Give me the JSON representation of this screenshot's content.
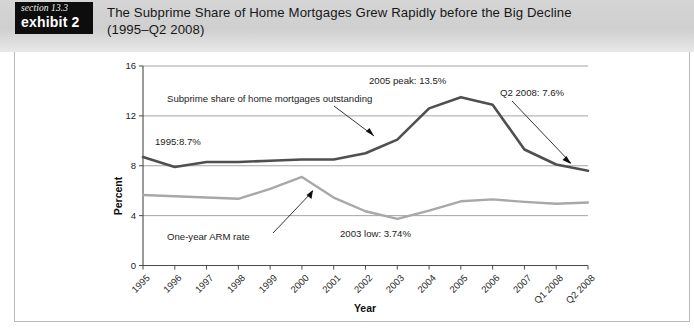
{
  "header": {
    "badge_section": "section 13.3",
    "badge_exhibit": "exhibit 2",
    "title_line1": "The Subprime Share of Home Mortgages Grew Rapidly before the Big Decline",
    "title_line2": "(1995–Q2 2008)"
  },
  "chart_data": {
    "type": "line",
    "title": "",
    "xlabel": "Year",
    "ylabel": "Percent",
    "ylim": [
      0,
      16
    ],
    "yticks": [
      0,
      4,
      8,
      12,
      16
    ],
    "grid": true,
    "legend": "none",
    "categories": [
      "1995",
      "1996",
      "1997",
      "1998",
      "1999",
      "2000",
      "2001",
      "2002",
      "2003",
      "2004",
      "2005",
      "2006",
      "2007",
      "Q1 2008",
      "Q2 2008"
    ],
    "series": [
      {
        "name": "Subprime share of home mortgages outstanding",
        "color": "#4f4f4f",
        "values": [
          8.7,
          7.9,
          8.3,
          8.3,
          8.4,
          8.5,
          8.5,
          9.0,
          10.1,
          12.6,
          13.5,
          12.9,
          9.3,
          8.1,
          7.6
        ]
      },
      {
        "name": "One-year ARM rate",
        "color": "#a8a8a8",
        "values": [
          5.65,
          5.55,
          5.45,
          5.35,
          6.15,
          7.1,
          5.45,
          4.35,
          3.74,
          4.4,
          5.15,
          5.3,
          5.1,
          4.95,
          5.05
        ]
      }
    ],
    "annotations": [
      {
        "id": "subprime-series-label",
        "text": "Subprime share of home mortgages outstanding"
      },
      {
        "id": "start-value-label",
        "text": "1995:8.7%"
      },
      {
        "id": "peak-label",
        "text": "2005 peak: 13.5%"
      },
      {
        "id": "end-value-label",
        "text": "Q2 2008: 7.6%"
      },
      {
        "id": "arm-series-label",
        "text": "One-year ARM rate"
      },
      {
        "id": "arm-low-label",
        "text": "2003 low: 3.74%"
      }
    ]
  }
}
